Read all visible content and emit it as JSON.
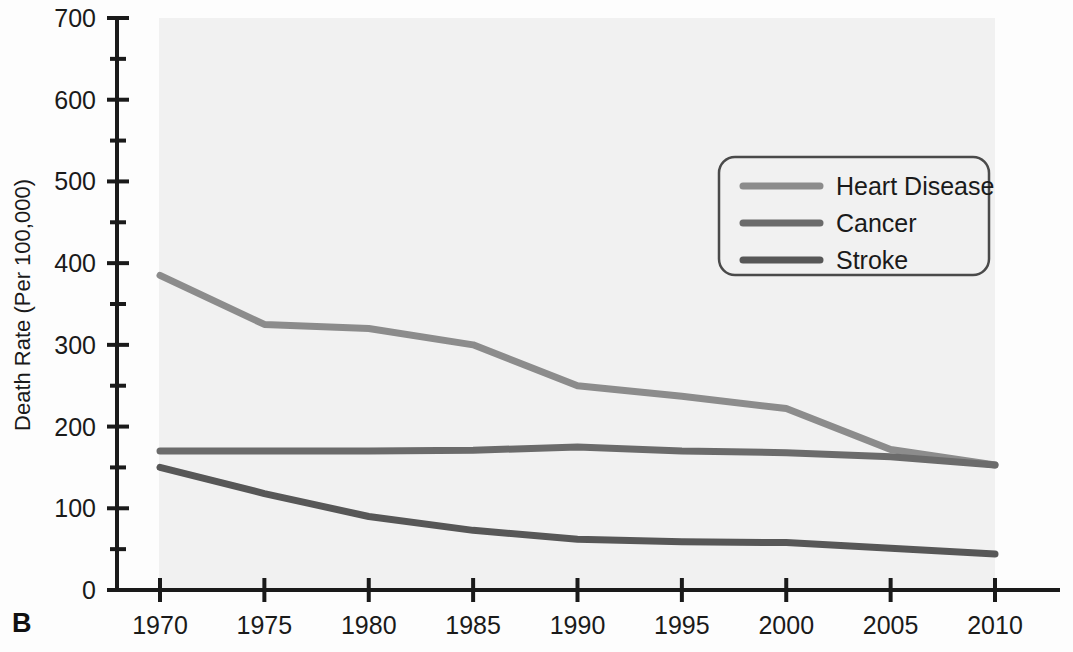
{
  "panel": {
    "label": "B"
  },
  "chart_data": {
    "type": "line",
    "title": "",
    "xlabel": "",
    "ylabel": "Death Rate (Per 100,000)",
    "x": [
      1970,
      1975,
      1980,
      1985,
      1990,
      1995,
      2000,
      2005,
      2010
    ],
    "xticklabels": [
      "1970",
      "1975",
      "1980",
      "1985",
      "1990",
      "1995",
      "2000",
      "2005",
      "2010"
    ],
    "yticklabels": [
      "0",
      "100",
      "200",
      "300",
      "400",
      "500",
      "600",
      "700"
    ],
    "yticks": [
      0,
      100,
      200,
      300,
      400,
      500,
      600,
      700
    ],
    "yminorticks": [
      50,
      150,
      250,
      350,
      450,
      550,
      650
    ],
    "xlim": [
      1970,
      2010
    ],
    "ylim": [
      0,
      700
    ],
    "grid": false,
    "legend_position": "upper right",
    "series": [
      {
        "name": "Heart Disease",
        "color": "#8c8c8c",
        "values": [
          385,
          325,
          320,
          300,
          250,
          237,
          222,
          172,
          153
        ]
      },
      {
        "name": "Cancer",
        "color": "#6b6b6b",
        "values": [
          170,
          170,
          170,
          171,
          175,
          170,
          168,
          163,
          153
        ]
      },
      {
        "name": "Stroke",
        "color": "#575757",
        "values": [
          150,
          118,
          90,
          73,
          62,
          59,
          58,
          51,
          44
        ]
      }
    ]
  },
  "legend": {
    "items": [
      {
        "label": "Heart Disease",
        "color": "#8c8c8c"
      },
      {
        "label": "Cancer",
        "color": "#6b6b6b"
      },
      {
        "label": "Stroke",
        "color": "#575757"
      }
    ]
  },
  "colors": {
    "axis": "#1a1a1a",
    "plot_background": "#f1f1f1",
    "page_background": "#fdfdfd",
    "legend_border": "#4a4a4a"
  }
}
